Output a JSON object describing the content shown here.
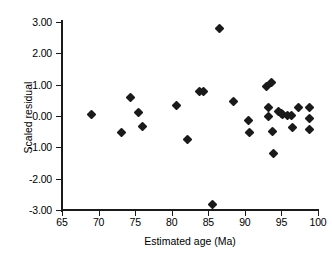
{
  "chart_data": {
    "type": "scatter",
    "title": "",
    "xlabel": "Estimated age (Ma)",
    "ylabel": "Scaled residual",
    "xlim": [
      65,
      100
    ],
    "ylim": [
      -3.0,
      3.0
    ],
    "xticks": [
      "65",
      "70",
      "75",
      "80",
      "85",
      "90",
      "95",
      "100"
    ],
    "xtick_values": [
      65,
      70,
      75,
      80,
      85,
      90,
      95,
      100
    ],
    "yticks": [
      "3.00",
      "2.00",
      "1.00",
      "0.00",
      "-1.00",
      "-2.00",
      "-3.00"
    ],
    "ytick_values": [
      3,
      2,
      1,
      0,
      -1,
      -2,
      -3
    ],
    "grid": false,
    "legend": null,
    "marker": "filled-diamond",
    "marker_color": "#1a1a1a",
    "points": [
      {
        "x": 69.1,
        "y": 0.05
      },
      {
        "x": 73.2,
        "y": -0.53
      },
      {
        "x": 74.4,
        "y": 0.6
      },
      {
        "x": 75.5,
        "y": 0.11
      },
      {
        "x": 76.0,
        "y": -0.34
      },
      {
        "x": 80.6,
        "y": 0.35
      },
      {
        "x": 82.1,
        "y": -0.76
      },
      {
        "x": 83.8,
        "y": 0.77
      },
      {
        "x": 84.4,
        "y": 0.77
      },
      {
        "x": 85.6,
        "y": -2.83
      },
      {
        "x": 86.6,
        "y": 2.8
      },
      {
        "x": 88.4,
        "y": 0.47
      },
      {
        "x": 90.5,
        "y": -0.14
      },
      {
        "x": 90.6,
        "y": -0.54
      },
      {
        "x": 92.9,
        "y": 0.93
      },
      {
        "x": 93.3,
        "y": 0.26
      },
      {
        "x": 93.3,
        "y": -0.03
      },
      {
        "x": 93.7,
        "y": 1.06
      },
      {
        "x": 93.8,
        "y": -0.51
      },
      {
        "x": 93.9,
        "y": -1.19
      },
      {
        "x": 94.6,
        "y": 0.13
      },
      {
        "x": 95.0,
        "y": 0.08
      },
      {
        "x": 95.2,
        "y": 0.05
      },
      {
        "x": 95.8,
        "y": 0.02
      },
      {
        "x": 96.4,
        "y": 0.03
      },
      {
        "x": 96.5,
        "y": -0.38
      },
      {
        "x": 97.3,
        "y": 0.28
      },
      {
        "x": 98.9,
        "y": 0.28
      },
      {
        "x": 98.9,
        "y": -0.07
      },
      {
        "x": 98.9,
        "y": -0.42
      }
    ]
  }
}
